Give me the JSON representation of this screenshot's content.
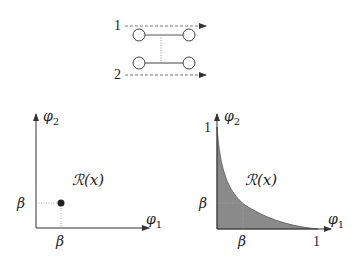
{
  "top_diagram": {
    "lines": [
      {
        "label": "1"
      },
      {
        "label": "2"
      }
    ]
  },
  "left_plot": {
    "x_axis_label": "φ",
    "x_axis_sub": "1",
    "y_axis_label": "φ",
    "y_axis_sub": "2",
    "region_label": "ℛ(x)",
    "x_tick": "β",
    "y_tick": "β"
  },
  "right_plot": {
    "x_axis_label": "φ",
    "x_axis_sub": "1",
    "y_axis_label": "φ",
    "y_axis_sub": "2",
    "region_label": "ℛ(x)",
    "x_ticks": [
      "β",
      "1"
    ],
    "y_ticks": [
      "β",
      "1"
    ],
    "fill_color": "#8a8a8a"
  }
}
